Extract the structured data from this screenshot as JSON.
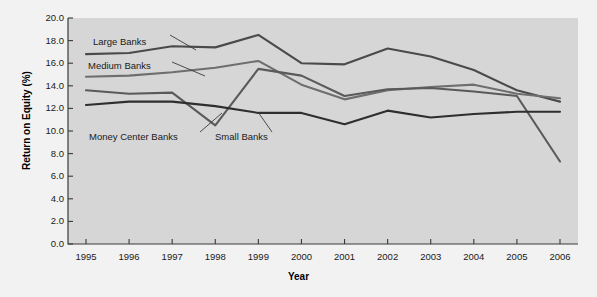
{
  "chart_data": {
    "type": "line",
    "title": "",
    "xlabel": "Year",
    "ylabel": "Return on Equity (%)",
    "categories": [
      1995,
      1996,
      1997,
      1998,
      1999,
      2000,
      2001,
      2002,
      2003,
      2004,
      2005,
      2006
    ],
    "x_tick_labels": [
      "1995",
      "1996",
      "1997",
      "1998",
      "1999",
      "2000",
      "2001",
      "2002",
      "2003",
      "2004",
      "2005",
      "2006"
    ],
    "y_tick_labels": [
      "0.0",
      "2.0",
      "4.0",
      "6.0",
      "8.0",
      "10.0",
      "12.0",
      "14.0",
      "16.0",
      "18.0",
      "20.0"
    ],
    "ylim": [
      0.0,
      20.0
    ],
    "y_tick_step": 2.0,
    "grid": false,
    "legend": "inline-annotations",
    "series": [
      {
        "name": "Large Banks",
        "color": "#4a4a4a",
        "values": [
          16.8,
          16.9,
          17.5,
          17.4,
          18.5,
          16.0,
          15.9,
          17.3,
          16.6,
          15.4,
          13.6,
          12.6
        ]
      },
      {
        "name": "Medium Banks",
        "color": "#6e6e6e",
        "values": [
          14.8,
          14.9,
          15.2,
          15.6,
          16.2,
          14.1,
          12.8,
          13.6,
          13.9,
          14.1,
          13.3,
          12.9
        ]
      },
      {
        "name": "Money Center Banks",
        "color": "#5a5a5a",
        "values": [
          13.6,
          13.3,
          13.4,
          10.5,
          15.5,
          14.9,
          13.1,
          13.7,
          13.8,
          13.5,
          13.1,
          7.3
        ]
      },
      {
        "name": "Small Banks",
        "color": "#2e2e2e",
        "values": [
          12.3,
          12.6,
          12.6,
          12.2,
          11.6,
          11.6,
          10.6,
          11.8,
          11.2,
          11.5,
          11.7,
          11.7
        ]
      }
    ],
    "annotations": [
      {
        "label": "Large Banks",
        "x": 93,
        "y": 36
      },
      {
        "label": "Medium Banks",
        "x": 88,
        "y": 60
      },
      {
        "label": "Money Center Banks",
        "x": 89,
        "y": 131
      },
      {
        "label": "Small Banks",
        "x": 215,
        "y": 131
      }
    ]
  }
}
